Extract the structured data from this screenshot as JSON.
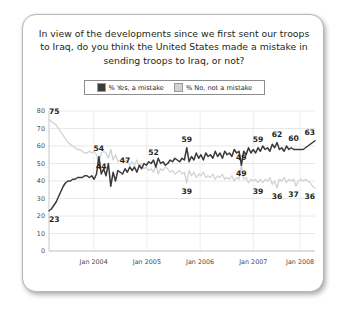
{
  "title": "In view of the developments since we first sent our troops to Iraq, do you think the United States made a mistake in sending troops to Iraq, or not?",
  "legend": {
    "entries": [
      {
        "label": "% Yes, a mistake",
        "color": "#3a3a3a",
        "name": "yes-a-mistake"
      },
      {
        "label": "% No, not a mistake",
        "color": "#d2d2d2",
        "name": "no-not-a-mistake"
      }
    ]
  },
  "chart_data": {
    "type": "line",
    "title": "In view of the developments since we first sent our troops to Iraq, do you think the United States made a mistake in sending troops to Iraq, or not?",
    "xlabel": "",
    "ylabel": "",
    "ylim": [
      0,
      80
    ],
    "yticks": [
      0,
      10,
      20,
      30,
      40,
      50,
      60,
      70,
      80
    ],
    "xticks": [
      "Jan 2004",
      "Jan 2005",
      "Jan 2006",
      "Jan 2007",
      "Jan 2008"
    ],
    "xtick_positions": [
      0.168,
      0.368,
      0.568,
      0.768,
      0.944
    ],
    "grid": true,
    "legend_position": "top",
    "series": [
      {
        "name": "% Yes, a mistake",
        "color": "#3a3a3a",
        "values": [
          23,
          24,
          26,
          28,
          31,
          34,
          37,
          39,
          40,
          40,
          41,
          41,
          42,
          42,
          42,
          43,
          43,
          42,
          43,
          41,
          44,
          54,
          44,
          47,
          43,
          50,
          37,
          45,
          40,
          46,
          45,
          44,
          47,
          45,
          48,
          46,
          48,
          45,
          49,
          47,
          50,
          49,
          51,
          50,
          52,
          48,
          53,
          50,
          51,
          49,
          50,
          52,
          51,
          53,
          52,
          51,
          53,
          52,
          59,
          51,
          54,
          52,
          56,
          53,
          55,
          52,
          56,
          54,
          55,
          53,
          57,
          54,
          56,
          53,
          57,
          55,
          56,
          54,
          58,
          56,
          57,
          49,
          57,
          55,
          59,
          56,
          58,
          56,
          59,
          57,
          60,
          58,
          59,
          57,
          61,
          59,
          62,
          58,
          59,
          57,
          60,
          58,
          59,
          58,
          58,
          58,
          58,
          58,
          59,
          60,
          61,
          62,
          63
        ]
      },
      {
        "name": "% No, not a mistake",
        "color": "#d2d2d2",
        "values": [
          75,
          74,
          73,
          72,
          70,
          68,
          66,
          64,
          62,
          61,
          60,
          59,
          58,
          58,
          57,
          56,
          56,
          57,
          56,
          57,
          55,
          49,
          56,
          57,
          56,
          53,
          58,
          52,
          55,
          51,
          52,
          53,
          51,
          52,
          49,
          51,
          49,
          52,
          48,
          50,
          47,
          48,
          46,
          47,
          45,
          49,
          44,
          47,
          46,
          48,
          47,
          45,
          46,
          44,
          45,
          46,
          44,
          45,
          39,
          46,
          43,
          45,
          42,
          44,
          43,
          45,
          42,
          43,
          42,
          44,
          41,
          43,
          42,
          44,
          41,
          42,
          41,
          43,
          40,
          42,
          41,
          49,
          41,
          42,
          39,
          41,
          40,
          41,
          39,
          41,
          39,
          41,
          40,
          42,
          38,
          40,
          36,
          41,
          40,
          42,
          39,
          41,
          40,
          41,
          37,
          40,
          41,
          40,
          41,
          40,
          39,
          37,
          36
        ]
      }
    ],
    "annotations": [
      {
        "text": "75",
        "series": "% No, not a mistake",
        "value": 75,
        "index": 0
      },
      {
        "text": "23",
        "series": "% Yes, a mistake",
        "value": 23,
        "index": 0
      },
      {
        "text": "54",
        "series": "% Yes, a mistake",
        "value": 54,
        "index": 21
      },
      {
        "text": "44",
        "series": "% Yes, a mistake",
        "value": 44,
        "index": 22
      },
      {
        "text": "52",
        "series": "% Yes, a mistake",
        "value": 52,
        "index": 44
      },
      {
        "text": "47",
        "series": "% Yes, a mistake",
        "value": 47,
        "index": 32
      },
      {
        "text": "59",
        "series": "% Yes, a mistake",
        "value": 59,
        "index": 58
      },
      {
        "text": "39",
        "series": "% No, not a mistake",
        "value": 39,
        "index": 58
      },
      {
        "text": "49",
        "series": "% Yes, a mistake",
        "value": 49,
        "index": 81
      },
      {
        "text": "49",
        "series": "% No, not a mistake",
        "value": 49,
        "index": 81
      },
      {
        "text": "59",
        "series": "% Yes, a mistake",
        "value": 59,
        "index": 88
      },
      {
        "text": "39",
        "series": "% No, not a mistake",
        "value": 39,
        "index": 88
      },
      {
        "text": "62",
        "series": "% Yes, a mistake",
        "value": 62,
        "index": 96
      },
      {
        "text": "36",
        "series": "% No, not a mistake",
        "value": 36,
        "index": 96
      },
      {
        "text": "60",
        "series": "% Yes, a mistake",
        "value": 60,
        "index": 103
      },
      {
        "text": "37",
        "series": "% No, not a mistake",
        "value": 37,
        "index": 103
      },
      {
        "text": "63",
        "series": "% Yes, a mistake",
        "value": 63,
        "index": 112
      },
      {
        "text": "36",
        "series": "% No, not a mistake",
        "value": 36,
        "index": 112
      }
    ]
  }
}
